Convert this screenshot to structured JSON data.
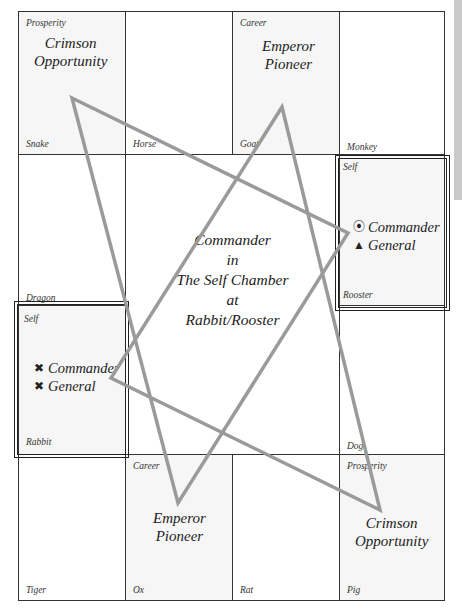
{
  "chart": {
    "center": {
      "line1": "Commander",
      "line2": "in",
      "line3": "The Self Chamber",
      "line4": "at",
      "line5": "Rabbit/Rooster"
    },
    "cells": {
      "snake": {
        "top": "Prosperity",
        "bottom": "Snake"
      },
      "horse": {
        "top": "",
        "bottom": "Horse"
      },
      "goat": {
        "top": "Career",
        "bottom": "Goat"
      },
      "monkey": {
        "top": "",
        "bottom": "Monkey"
      },
      "dragon": {
        "top": "",
        "bottom": "Dragon"
      },
      "rooster": {
        "top": "Self",
        "bottom": "Rooster"
      },
      "rabbit": {
        "top": "Self",
        "bottom": "Rabbit"
      },
      "dog": {
        "top": "",
        "bottom": "Dog"
      },
      "tiger": {
        "top": "",
        "bottom": "Tiger"
      },
      "ox": {
        "top": "Career",
        "bottom": "Ox"
      },
      "rat": {
        "top": "",
        "bottom": "Rat"
      },
      "pig": {
        "top": "Prosperity",
        "bottom": "Pig"
      }
    },
    "stars": {
      "snake_l1": "Crimson",
      "snake_l2": "Opportunity",
      "goat_l1": "Emperor",
      "goat_l2": "Pioneer",
      "ox_l1": "Emperor",
      "ox_l2": "Pioneer",
      "pig_l1": "Crimson",
      "pig_l2": "Opportunity"
    },
    "rooster_marks": [
      {
        "glyph": "⦿",
        "icon": "circle-dot-icon",
        "label": "Commander"
      },
      {
        "glyph": "▲",
        "icon": "triangle-icon",
        "label": "General"
      }
    ],
    "rabbit_marks": [
      {
        "glyph": "✖",
        "icon": "x-mark-icon",
        "label": "Commander"
      },
      {
        "glyph": "✖",
        "icon": "x-mark-icon",
        "label": "General"
      }
    ],
    "colors": {
      "line": "#9a9a9a",
      "grid": "#333333",
      "shade": "#f6f6f6"
    }
  }
}
